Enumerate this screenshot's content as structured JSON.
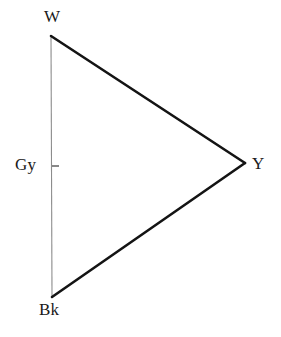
{
  "figure": {
    "background_color": "#ffffff",
    "width": 281,
    "height": 337
  },
  "vertices": [
    {
      "id": "white",
      "label": "W",
      "name": "white",
      "x": 51,
      "y": 36,
      "label_x": 44,
      "label_y": 8
    },
    {
      "id": "yellow",
      "label": "Y",
      "name": "yellow",
      "x": 245,
      "y": 163,
      "label_x": 252,
      "label_y": 155
    },
    {
      "id": "black",
      "label": "Bk",
      "name": "black",
      "x": 52,
      "y": 297,
      "label_x": 39,
      "label_y": 301
    }
  ],
  "axis_markers": [
    {
      "id": "grey",
      "label": "Gy",
      "name": "grey",
      "x": 52,
      "y": 166,
      "label_x": 15,
      "label_y": 156,
      "tick_x1": 52,
      "tick_x2": 59,
      "tick_y": 166
    }
  ],
  "edges": [
    {
      "id": "white-yellow",
      "from": "white",
      "to": "yellow",
      "x1": 51,
      "y1": 36,
      "x2": 245,
      "y2": 163,
      "stroke": "#141414",
      "stroke_width": 2.6
    },
    {
      "id": "yellow-black",
      "from": "yellow",
      "to": "black",
      "x1": 245,
      "y1": 163,
      "x2": 52,
      "y2": 297,
      "stroke": "#141414",
      "stroke_width": 2.6
    },
    {
      "id": "white-black",
      "from": "white",
      "to": "black",
      "x1": 51,
      "y1": 36,
      "x2": 52,
      "y2": 297,
      "stroke": "#8c8c8c",
      "stroke_width": 1.1
    }
  ],
  "colors": {
    "edge_dark": "#141414",
    "edge_light": "#8c8c8c",
    "tick": "#555555",
    "text": "#1a1a1a",
    "background": "#ffffff"
  }
}
